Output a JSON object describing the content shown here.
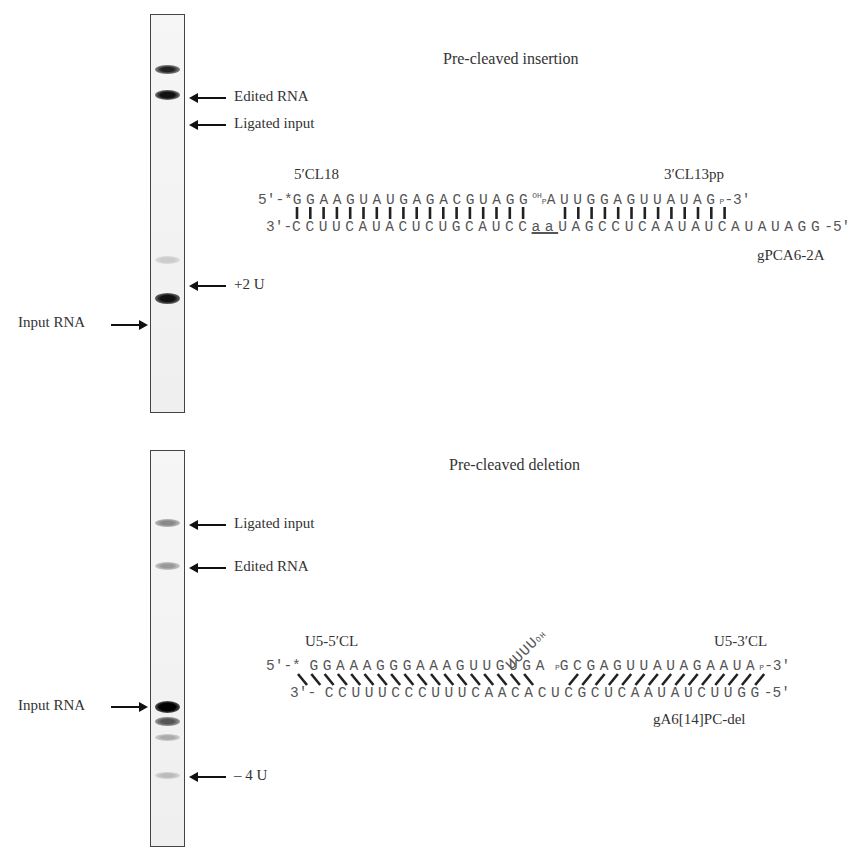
{
  "panels": [
    {
      "title": "Pre-cleaved insertion",
      "gel_labels": {
        "edited": "Edited RNA",
        "ligated": "Ligated input",
        "plus2u": "+2 U",
        "input": "Input RNA"
      },
      "oligo_5": "5′CL18",
      "oligo_3": "3′CL13pp",
      "guide": "gPCA6-2A",
      "top_prefix": "5′-*",
      "top_seq_5": "GGAAGUAUGAGACGUAGG",
      "top_oh": "OH",
      "top_p": "P",
      "top_seq_3": "AUUGGAGUUAUAG",
      "top_p_end": "P",
      "top_suffix": "-3′",
      "bottom_prefix": "3′-",
      "bottom_seq_a": "CCUUCAUACUCUGCAUCC",
      "bottom_insert": "aa",
      "bottom_seq_b": "UAGCCUCAAUAUCAUAUAGG",
      "bottom_suffix": "-5′"
    },
    {
      "title": "Pre-cleaved deletion",
      "gel_labels": {
        "ligated": "Ligated input",
        "edited": "Edited RNA",
        "input": "Input RNA",
        "minus4u": "– 4 U"
      },
      "oligo_5": "U5-5′CL",
      "oligo_3": "U5-3′CL",
      "guide": "gA6[14]PC-del",
      "top_prefix": "5′-*",
      "top_seq_5": "GGAAAGGGAAAGUUGUGA",
      "bulge": "UUUU",
      "bulge_oh": "OH",
      "top_p": "P",
      "top_seq_3": "GCGAGUUAUAGAAUA",
      "top_p_end": "P",
      "top_suffix": "-3′",
      "bottom_prefix": "3′-",
      "bottom_seq": "CCUUUCCCUUUCAACACUCGCUCAAUAUCUUGG",
      "bottom_suffix": "-5′"
    }
  ]
}
